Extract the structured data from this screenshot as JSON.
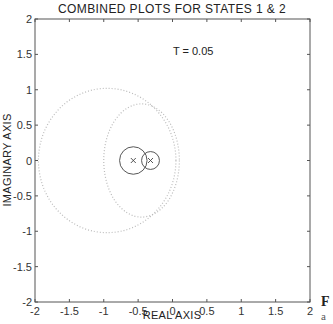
{
  "chart_data": {
    "type": "scatter",
    "title": "COMBINED PLOTS FOR STATES 1 & 2",
    "xlabel": "REAL AXIS",
    "ylabel": "IMAGINARY AXIS",
    "xlim": [
      -2,
      2
    ],
    "ylim": [
      -2,
      2
    ],
    "grid": false,
    "x_ticks": [
      "-2",
      "-1.5",
      "-1",
      "-0.5",
      "0",
      "0.5",
      "1",
      "1.5",
      "2"
    ],
    "y_ticks": [
      "2",
      "1.5",
      "1",
      "0.5",
      "0",
      "-0.5",
      "-1",
      "-1.5",
      "-2"
    ],
    "annotations": [
      {
        "text": "T = 0.05",
        "x": 0.05,
        "y": 1.55
      }
    ],
    "series": [
      {
        "name": "State 1 pole",
        "marker": "x",
        "x": -0.57,
        "y": 0.0,
        "circle_radius": 0.2,
        "style": "solid"
      },
      {
        "name": "State 2 pole",
        "marker": "x",
        "x": -0.32,
        "y": 0.0,
        "circle_radius": 0.13,
        "style": "solid"
      },
      {
        "name": "Outer dotted locus",
        "style": "dotted",
        "center": [
          -0.95,
          0.0
        ],
        "rx": 1.0,
        "ry": 1.02
      },
      {
        "name": "Inner dotted locus",
        "style": "dotted",
        "center": [
          -0.45,
          0.0
        ],
        "rx": 0.55,
        "ry": 0.8
      }
    ]
  },
  "side_caption": {
    "letter": "F",
    "sub": "a"
  }
}
